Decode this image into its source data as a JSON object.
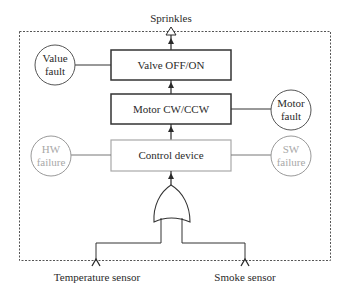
{
  "diagram": {
    "output_label": "Sprinkles",
    "blocks": [
      {
        "id": "valve",
        "label": "Valve OFF/ON",
        "style": "dark"
      },
      {
        "id": "motor",
        "label": "Motor CW/CCW",
        "style": "dark"
      },
      {
        "id": "control",
        "label": "Control device",
        "style": "light"
      }
    ],
    "faults": [
      {
        "id": "value-fault",
        "line1": "Value",
        "line2": "fault",
        "attached_to": "valve",
        "side": "left",
        "style": "dark"
      },
      {
        "id": "motor-fault",
        "line1": "Motor",
        "line2": "fault",
        "attached_to": "motor",
        "side": "right",
        "style": "dark"
      },
      {
        "id": "hw-failure",
        "line1": "HW",
        "line2": "failure",
        "attached_to": "control",
        "side": "left",
        "style": "light"
      },
      {
        "id": "sw-failure",
        "line1": "SW",
        "line2": "failure",
        "attached_to": "control",
        "side": "right",
        "style": "light"
      }
    ],
    "gate": {
      "type": "OR"
    },
    "inputs": [
      {
        "id": "temperature-sensor",
        "label": "Temperature sensor"
      },
      {
        "id": "smoke-sensor",
        "label": "Smoke sensor"
      }
    ],
    "colors": {
      "dark_stroke": "#3a3a3a",
      "light_stroke": "#a8a8a8",
      "text": "#2a2a2a",
      "light_text": "#a8a8a8",
      "boundary": "#555555"
    }
  }
}
